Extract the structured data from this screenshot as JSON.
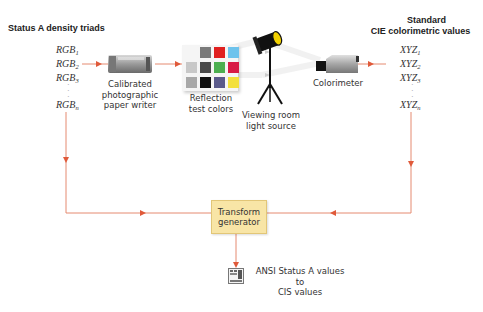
{
  "diagram": {
    "left_column": {
      "title": "Status A density triads",
      "items": [
        {
          "base": "RGB",
          "sub": "1"
        },
        {
          "base": "RGB",
          "sub": "2"
        },
        {
          "base": "RGB",
          "sub": "3"
        },
        {
          "base": "RGB",
          "sub": "n"
        }
      ]
    },
    "right_column": {
      "title_line1": "Standard",
      "title_line2": "CIE colorimetric values",
      "items": [
        {
          "base": "XYZ",
          "sub": "1"
        },
        {
          "base": "XYZ",
          "sub": "2"
        },
        {
          "base": "XYZ",
          "sub": "3"
        },
        {
          "base": "XYZ",
          "sub": "n"
        }
      ]
    },
    "nodes": {
      "paper_writer": {
        "line1": "Calibrated",
        "line2": "photographic",
        "line3": "paper writer"
      },
      "test_colors": {
        "line1": "Reflection",
        "line2": "test colors"
      },
      "light_source": {
        "line1": "Viewing room",
        "line2": "light source"
      },
      "colorimeter": {
        "line1": "Colorimeter"
      },
      "transform": {
        "line1": "Transform",
        "line2": "generator"
      },
      "output": {
        "line1": "ANSI Status A values",
        "line2": "to",
        "line3": "CIS values"
      }
    },
    "swatches": [
      null,
      "#7a7a7a",
      "#e02020",
      "#6ec3ec",
      "#c8c8c8",
      "#4a4a4a",
      "#4caf50",
      "#d81b45",
      "#a8a8a8",
      "#111111",
      "#5a5a8a",
      "#f3e03c"
    ],
    "colors": {
      "arrow": "#e06a4a",
      "transform_fill": "#f8e5a6",
      "transform_border": "#e2c677"
    }
  }
}
